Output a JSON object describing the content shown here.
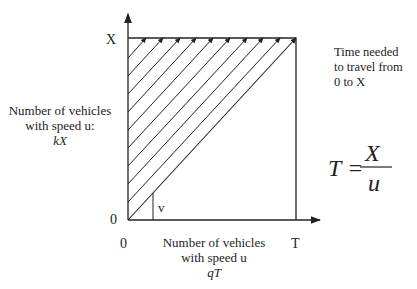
{
  "diagram": {
    "y_axis": {
      "top_label": "X",
      "origin_label": "0"
    },
    "x_axis": {
      "origin_label": "0",
      "end_label": "T"
    },
    "trajectory_label": "v",
    "left_label": {
      "line1": "Number of vehicles",
      "line2": "with speed u:",
      "line3": "kX"
    },
    "bottom_label": {
      "line1": "Number of vehicles",
      "line2": "with speed u",
      "line3": "qT"
    },
    "right_note": {
      "line1": "Time needed",
      "line2": "to travel from",
      "line3": "0 to X"
    },
    "formula": {
      "lhs": "T =",
      "numerator": "X",
      "denominator": "u"
    },
    "colors": {
      "line": "#222222",
      "background": "#ffffff"
    }
  }
}
